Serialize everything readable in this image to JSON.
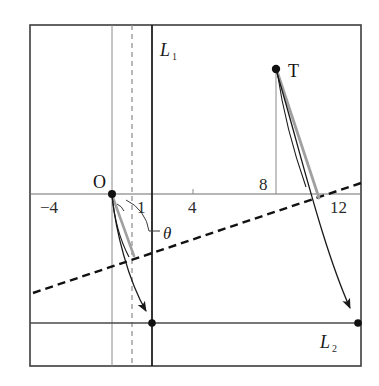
{
  "figure": {
    "kind": "geometry-diagram",
    "title_visible": false,
    "background_color": "#ffffff",
    "frame": {
      "name": "outer-frame",
      "x": 30,
      "y": 25,
      "width": 331,
      "height": 341,
      "stroke": "#3d3d3d"
    },
    "colors": {
      "axis": "#6e6e6e",
      "line_dark": "#1a1a1a",
      "line_gray": "#9a9a9a",
      "dashed": "#111111",
      "text": "#1a1a1a",
      "thin_rule": "#8a8a8a"
    }
  },
  "axes": {
    "x_axis_label": "",
    "y_axis_label": "",
    "x_ticks": [
      {
        "label": "-4",
        "display": "−4",
        "px": 57
      },
      {
        "label": "1",
        "display": "1",
        "px": 138
      },
      {
        "label": "4",
        "display": "4",
        "px": 193
      },
      {
        "label": "8",
        "display": "8",
        "px": 266
      },
      {
        "label": "12",
        "display": "12",
        "px": 342
      }
    ],
    "x_axis_y_px": 194,
    "origin_label": "O"
  },
  "lines": {
    "L1": {
      "label": "L₁",
      "label_main": "L",
      "label_sub": "1",
      "orientation": "vertical",
      "x_px": 152,
      "style": "solid-thick"
    },
    "L2": {
      "label": "L₂",
      "label_main": "L",
      "label_sub": "2",
      "orientation": "horizontal",
      "y_px": 323,
      "style": "solid-thick"
    },
    "dashed_ray": {
      "label": "",
      "style": "dashed",
      "from_px": [
        33,
        293
      ],
      "to_px": [
        361,
        183
      ]
    },
    "vertical_thin_at_O": {
      "x_px": 112,
      "style": "solid-thin"
    },
    "vertical_dashed_at_1": {
      "x_px": 132,
      "style": "dashed-thin"
    },
    "vertical_thin_at_8": {
      "x_px": 276,
      "style": "solid-thin"
    }
  },
  "points": [
    {
      "name": "O",
      "label": "O",
      "x_px": 112,
      "y_px": 194,
      "marker": "filled-dot"
    },
    {
      "name": "T",
      "label": "T",
      "x_px": 276,
      "y_px": 69,
      "marker": "filled-dot"
    },
    {
      "name": "foot-left",
      "label": "",
      "x_px": 152,
      "y_px": 323,
      "marker": "filled-dot"
    },
    {
      "name": "foot-right",
      "label": "",
      "x_px": 358,
      "y_px": 323,
      "marker": "filled-dot"
    }
  ],
  "angle": {
    "label": "θ",
    "vertex_px": [
      112,
      194
    ],
    "label_px": [
      172,
      232
    ]
  },
  "segments": {
    "gray_from_O": {
      "from_px": [
        112,
        194
      ],
      "to_px": [
        133,
        255
      ],
      "color": "#9a9a9a"
    },
    "gray_from_T": {
      "from_px": [
        276,
        69
      ],
      "to_px": [
        318,
        197
      ],
      "color": "#9a9a9a"
    },
    "dark_from_O": {
      "from_px": [
        112,
        194
      ],
      "to_px": [
        129,
        256
      ],
      "color": "#1a1a1a"
    },
    "dark_from_T": {
      "from_px": [
        276,
        69
      ],
      "to_px": [
        305,
        186
      ],
      "color": "#1a1a1a"
    }
  },
  "arrows": [
    {
      "name": "arrow-left-curve",
      "from_px": [
        112,
        196
      ],
      "to_px": [
        151,
        318
      ],
      "direction": "down-right"
    },
    {
      "name": "arrow-right-curve",
      "from_px": [
        277,
        73
      ],
      "to_px": [
        356,
        317
      ],
      "direction": "down-right"
    }
  ],
  "labels": {
    "point_O": "O",
    "point_T": "T",
    "line_L1": "L₁",
    "line_L2": "L₂",
    "theta": "θ",
    "tick_minus4": "−4",
    "tick_1": "1",
    "tick_4": "4",
    "tick_8": "8",
    "tick_12": "12"
  }
}
